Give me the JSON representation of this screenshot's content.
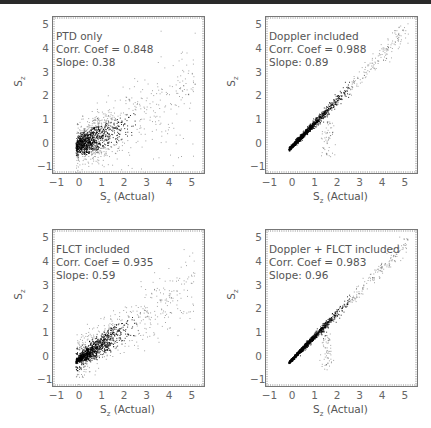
{
  "figure": {
    "panels": [
      {
        "id": "ptd",
        "label": "PTD only",
        "corr": "Corr. Coef = 0.848",
        "slope": "Slope: 0.38",
        "xlabel_main": "S",
        "xlabel_sub": "z",
        "xlabel_rest": " (Actual)",
        "ylabel_main": "S",
        "ylabel_sub": "z"
      },
      {
        "id": "doppler",
        "label": "Doppler included",
        "corr": "Corr. Coef = 0.988",
        "slope": "Slope: 0.89",
        "xlabel_main": "S",
        "xlabel_sub": "z",
        "xlabel_rest": " (Actual)",
        "ylabel_main": "S",
        "ylabel_sub": "z"
      },
      {
        "id": "flct",
        "label": "FLCT included",
        "corr": "Corr. Coef = 0.935",
        "slope": "Slope: 0.59",
        "xlabel_main": "S",
        "xlabel_sub": "z",
        "xlabel_rest": " (Actual)",
        "ylabel_main": "S",
        "ylabel_sub": "z"
      },
      {
        "id": "doppler_flct",
        "label": "Doppler + FLCT included",
        "corr": "Corr. Coef = 0.983",
        "slope": "Slope: 0.96",
        "xlabel_main": "S",
        "xlabel_sub": "z",
        "xlabel_rest": " (Actual)",
        "ylabel_main": "S",
        "ylabel_sub": "z"
      }
    ],
    "xticks": [
      "−1",
      "0",
      "1",
      "2",
      "3",
      "4",
      "5"
    ],
    "yticks": [
      "5",
      "4",
      "3",
      "2",
      "1",
      "0",
      "−1"
    ]
  },
  "chart_data": [
    {
      "type": "scatter",
      "title": "PTD only",
      "annotations": [
        "Corr. Coef = 0.848",
        "Slope: 0.38"
      ],
      "xlabel": "S_z (Actual)",
      "ylabel": "S_z",
      "xlim": [
        -1.2,
        5.5
      ],
      "ylim": [
        -1.2,
        5.4
      ],
      "correlation": 0.848,
      "slope": 0.38,
      "grid": false
    },
    {
      "type": "scatter",
      "title": "Doppler included",
      "annotations": [
        "Corr. Coef = 0.988",
        "Slope: 0.89"
      ],
      "xlabel": "S_z (Actual)",
      "ylabel": "S_z",
      "xlim": [
        -1.2,
        5.5
      ],
      "ylim": [
        -1.2,
        5.4
      ],
      "correlation": 0.988,
      "slope": 0.89,
      "grid": false
    },
    {
      "type": "scatter",
      "title": "FLCT included",
      "annotations": [
        "Corr. Coef = 0.935",
        "Slope: 0.59"
      ],
      "xlabel": "S_z (Actual)",
      "ylabel": "S_z",
      "xlim": [
        -1.2,
        5.5
      ],
      "ylim": [
        -1.2,
        5.4
      ],
      "correlation": 0.935,
      "slope": 0.59,
      "grid": false
    },
    {
      "type": "scatter",
      "title": "Doppler + FLCT included",
      "annotations": [
        "Corr. Coef = 0.983",
        "Slope: 0.96"
      ],
      "xlabel": "S_z (Actual)",
      "ylabel": "S_z",
      "xlim": [
        -1.2,
        5.5
      ],
      "ylim": [
        -1.2,
        5.4
      ],
      "correlation": 0.983,
      "slope": 0.96,
      "grid": false
    }
  ]
}
